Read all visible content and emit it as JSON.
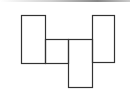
{
  "diagram": {
    "title": "",
    "stroke_color": "#333333",
    "background": "#ffffff",
    "shapes": [
      {
        "id": "rect-1",
        "x": 21,
        "y": 15,
        "w": 24,
        "h": 48
      },
      {
        "id": "rect-2",
        "x": 45,
        "y": 39,
        "w": 23,
        "h": 24
      },
      {
        "id": "rect-3",
        "x": 68,
        "y": 39,
        "w": 24,
        "h": 48
      },
      {
        "id": "rect-4",
        "x": 92,
        "y": 15,
        "w": 22,
        "h": 47
      },
      {
        "id": "connector-top",
        "x": 45,
        "y": 39,
        "w": 47,
        "h": 0
      }
    ]
  }
}
